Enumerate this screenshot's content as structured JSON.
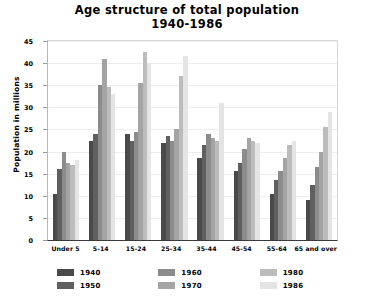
{
  "chart_data": {
    "type": "bar",
    "title": "Age structure of total population 1940-1986",
    "title_lines": [
      "Age structure of total population",
      "1940-1986"
    ],
    "xlabel": "",
    "ylabel": "Population in millions",
    "ylim": [
      0,
      45
    ],
    "yticks": [
      0,
      5,
      10,
      15,
      20,
      25,
      30,
      35,
      40,
      45
    ],
    "grid": true,
    "legend_position": "bottom",
    "categories": [
      "Under 5",
      "5-14",
      "15-24",
      "25-34",
      "35-44",
      "45-54",
      "55-64",
      "65 and over"
    ],
    "series": [
      {
        "name": "1940",
        "color": "#4a4a4a",
        "values": [
          10.5,
          22.5,
          24.0,
          22.0,
          18.5,
          15.5,
          10.5,
          9.0
        ]
      },
      {
        "name": "1950",
        "color": "#606060",
        "values": [
          16.0,
          24.0,
          22.5,
          23.5,
          21.5,
          17.5,
          13.5,
          12.5
        ]
      },
      {
        "name": "1960",
        "color": "#8c8c8c",
        "values": [
          20.0,
          35.0,
          24.5,
          22.5,
          24.0,
          20.5,
          15.5,
          16.5
        ]
      },
      {
        "name": "1970",
        "color": "#a4a4a4",
        "values": [
          17.5,
          41.0,
          35.5,
          25.0,
          23.0,
          23.0,
          18.5,
          20.0
        ]
      },
      {
        "name": "1980",
        "color": "#bcbcbc",
        "values": [
          17.0,
          34.5,
          42.5,
          37.0,
          22.5,
          22.5,
          21.5,
          25.5
        ]
      },
      {
        "name": "1986",
        "color": "#e4e4e4",
        "values": [
          18.0,
          33.0,
          40.0,
          41.5,
          31.0,
          22.0,
          22.5,
          29.0
        ]
      }
    ]
  }
}
